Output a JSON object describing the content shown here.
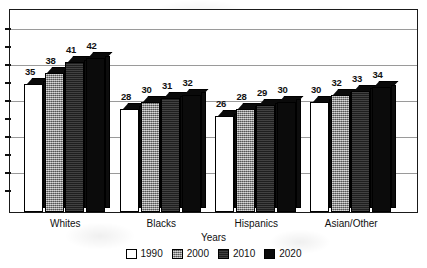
{
  "chart_data": {
    "type": "bar",
    "title": "",
    "xlabel": "Years",
    "ylabel": "",
    "categories": [
      "Whites",
      "Blacks",
      "Hispanics",
      "Asian/Other"
    ],
    "series": [
      {
        "name": "1990",
        "values": [
          35,
          28,
          26,
          30
        ],
        "color": "#ffffff"
      },
      {
        "name": "2000",
        "values": [
          38,
          30,
          28,
          32
        ],
        "color": "#8f8f8f"
      },
      {
        "name": "2010",
        "values": [
          41,
          31,
          29,
          33
        ],
        "color": "#2c2c2c"
      },
      {
        "name": "2020",
        "values": [
          42,
          32,
          30,
          34
        ],
        "color": "#0b0b0b"
      }
    ],
    "ylim": [
      0,
      50
    ],
    "gridlines": [
      10,
      20,
      30,
      40,
      50
    ],
    "grid": true,
    "legend_position": "bottom",
    "style": "3d-bars-grayscale"
  },
  "axis": {
    "x_title": "Years",
    "categories": [
      "Whites",
      "Blacks",
      "Hispanics",
      "Asian/Other"
    ]
  },
  "legend": {
    "items": [
      {
        "label": "1990",
        "swatch": "white-swatch"
      },
      {
        "label": "2000",
        "swatch": "gray-hatched-swatch"
      },
      {
        "label": "2010",
        "swatch": "dark-gray-swatch"
      },
      {
        "label": "2020",
        "swatch": "black-swatch"
      }
    ]
  },
  "labels": {
    "whites": [
      "35",
      "38",
      "41",
      "42"
    ],
    "blacks": [
      "28",
      "30",
      "31",
      "32"
    ],
    "hispanics": [
      "26",
      "28",
      "29",
      "30"
    ],
    "asian_other": [
      "30",
      "32",
      "33",
      "34"
    ]
  },
  "watermark": {
    "text": "5"
  }
}
